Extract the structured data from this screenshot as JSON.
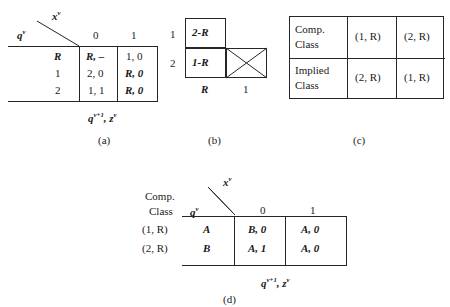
{
  "figure": {
    "caption_a": "(a)",
    "caption_b": "(b)",
    "caption_c": "(c)",
    "caption_d": "(d)"
  },
  "table_a": {
    "input_axis_label": "x",
    "input_axis_sup": "v",
    "state_axis_label": "q",
    "state_axis_sup": "v",
    "column_headers": [
      "0",
      "1"
    ],
    "row_labels": [
      "R",
      "1",
      "2"
    ],
    "cells": [
      [
        "R, –",
        "1, 0"
      ],
      [
        "2, 0",
        "R, 0"
      ],
      [
        "1, 1",
        "R, 0"
      ]
    ],
    "bottom_label_main": "q",
    "bottom_label_sup": "v+1",
    "bottom_label_tail": ", z",
    "bottom_label_tail_sup": "v"
  },
  "chart_b": {
    "row_labels": [
      "1",
      "2"
    ],
    "col_labels": [
      "R",
      "1"
    ],
    "cells": [
      {
        "row": 0,
        "col": 0,
        "text": "2-R",
        "crossed": false
      },
      {
        "row": 1,
        "col": 0,
        "text": "1-R",
        "crossed": false
      },
      {
        "row": 1,
        "col": 1,
        "text": "",
        "crossed": true
      }
    ]
  },
  "table_c": {
    "rows": [
      {
        "header": [
          "Comp.",
          "Class"
        ],
        "values": [
          "(1, R)",
          "(2, R)"
        ]
      },
      {
        "header": [
          "Implied",
          "Class"
        ],
        "values": [
          "(2, R)",
          "(1, R)"
        ]
      }
    ]
  },
  "table_d": {
    "corner_header": [
      "Comp.",
      "Class"
    ],
    "input_axis_label": "x",
    "input_axis_sup": "v",
    "state_axis_label": "q",
    "state_axis_sup": "v",
    "column_headers": [
      "0",
      "1"
    ],
    "class_labels": [
      "(1, R)",
      "(2, R)"
    ],
    "state_labels": [
      "A",
      "B"
    ],
    "cells": [
      [
        "B, 0",
        "A, 0"
      ],
      [
        "A, 1",
        "A, 0"
      ]
    ],
    "bottom_label_main": "q",
    "bottom_label_sup": "v+1",
    "bottom_label_tail": ", z",
    "bottom_label_tail_sup": "v"
  }
}
